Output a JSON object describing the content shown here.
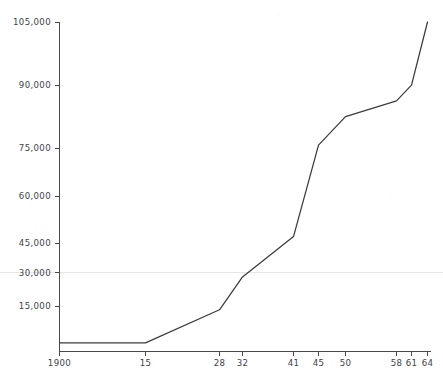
{
  "chart_data": {
    "type": "line",
    "title": "",
    "subtitle": "",
    "xlabel": "",
    "ylabel": "",
    "grid": "single faint horizontal rule at 25,000 spanning full image width",
    "legend": "none",
    "legend_position": "none",
    "line_color": "#3b3b3b",
    "gridline_color": "#e7e7ea",
    "axis_color": "#4a4a4a",
    "x": [
      "1900",
      "15",
      "28",
      "32",
      "41",
      "45",
      "50",
      "58",
      "61",
      "64"
    ],
    "x_tick_labels": [
      "1900",
      "15",
      "28",
      "32",
      "41",
      "45",
      "50",
      "58",
      "61",
      "64"
    ],
    "y_tick_labels": [
      "15,000",
      "30,000",
      "45,000",
      "60,000",
      "75,000",
      "90,000",
      "105,000"
    ],
    "y_tick_values": [
      15000,
      30000,
      45000,
      60000,
      75000,
      90000,
      105000
    ],
    "ylim": [
      0,
      105000
    ],
    "values": [
      3300,
      3300,
      13800,
      24200,
      37000,
      66000,
      75000,
      80000,
      85000,
      105000
    ],
    "series": [
      {
        "name": "series-1",
        "values": [
          3300,
          3300,
          13800,
          24200,
          37000,
          66000,
          75000,
          80000,
          85000,
          105000
        ]
      }
    ],
    "annotations": []
  },
  "geometry": {
    "x_pixels": [
      59,
      145,
      219,
      242,
      293,
      318,
      345,
      396,
      411,
      427
    ],
    "axis_left_px": 59,
    "axis_bottom_px": 351,
    "axis_top_px": 22,
    "gridline_y_px": 272,
    "y_tick_pixels": [
      306,
      272.5,
      243,
      196,
      148,
      85,
      22
    ]
  }
}
